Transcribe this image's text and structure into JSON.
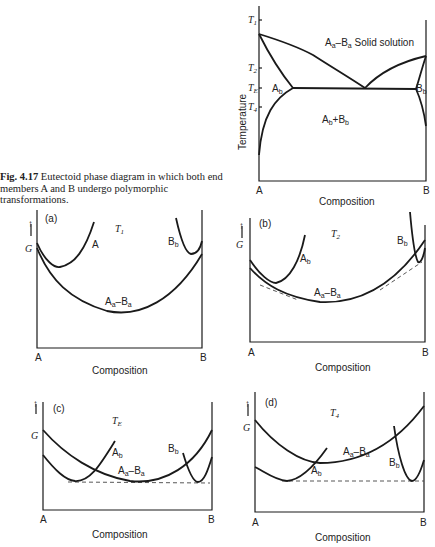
{
  "caption": {
    "figure_number": "Fig. 4.17",
    "text": "Eutectoid phase diagram in which both end members A and B undergo polymorphic transformations."
  },
  "phase_diagram": {
    "ylabel": "Temperature",
    "xlabel": "Composition",
    "x_ticks": [
      "A",
      "B"
    ],
    "y_ticks": [
      "T1",
      "T2",
      "TE",
      "T4"
    ],
    "regions": [
      "Aa–Ba Solid solution",
      "Ab",
      "Bb",
      "Ab+Bb"
    ]
  },
  "panels": [
    {
      "id": "(a)",
      "temperature": "T1",
      "xlabel": "Composition",
      "ylabel": "G",
      "x_ticks": [
        "A",
        "B"
      ],
      "curves": [
        "A",
        "Bb",
        "Aa–Ba"
      ]
    },
    {
      "id": "(b)",
      "temperature": "T2",
      "xlabel": "Composition",
      "ylabel": "G",
      "x_ticks": [
        "A",
        "B"
      ],
      "curves": [
        "Ab",
        "Bb",
        "Aa–Ba"
      ]
    },
    {
      "id": "(c)",
      "temperature": "TE",
      "xlabel": "Composition",
      "ylabel": "G",
      "x_ticks": [
        "A",
        "B"
      ],
      "curves": [
        "Ab",
        "Bb",
        "Aa–Ba"
      ]
    },
    {
      "id": "(d)",
      "temperature": "T4",
      "xlabel": "Composition",
      "ylabel": "G",
      "x_ticks": [
        "A",
        "B"
      ],
      "curves": [
        "Ab",
        "Bb",
        "Aa–Ba"
      ]
    }
  ],
  "labels": {
    "A": "A",
    "B": "B",
    "G": "G",
    "comp": "Composition",
    "temp": "Temperature",
    "T1": "T",
    "s1": "1",
    "T2": "T",
    "s2": "2",
    "TE": "T",
    "sE": "E",
    "T4": "T",
    "s4": "4",
    "pa": "(a)",
    "pb": "(b)",
    "pc": "(c)",
    "pd": "(d)",
    "Aa": "A",
    "a": "a",
    "dash": "–",
    "Ba": "B",
    "b": "b",
    "solid": " Solid solution",
    "Ab": "A",
    "Bb": "B",
    "plus": "+"
  }
}
